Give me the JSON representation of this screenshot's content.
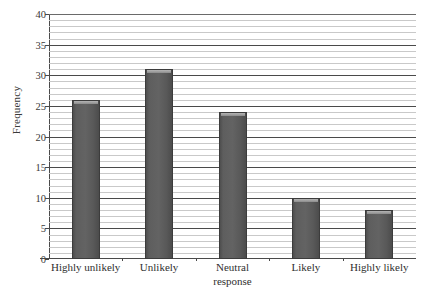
{
  "chart_data": {
    "type": "bar",
    "title": "",
    "xlabel": "",
    "ylabel": "Frequency",
    "categories": [
      "Highly unlikely",
      "Unlikely",
      "Neutral response",
      "Likely",
      "Highly likely"
    ],
    "category_lines": [
      [
        "Highly unlikely"
      ],
      [
        "Unlikely"
      ],
      [
        "Neutral",
        "response"
      ],
      [
        "Likely"
      ],
      [
        "Highly likely"
      ]
    ],
    "values": [
      26,
      31,
      24,
      10,
      8
    ],
    "ylim": [
      0,
      40
    ],
    "xlim": [
      0,
      5
    ],
    "y_major_ticks": [
      0,
      5,
      10,
      15,
      20,
      25,
      30,
      35,
      40
    ],
    "y_tick_labels": [
      "0",
      "5",
      "10",
      "15",
      "20",
      "25",
      "30",
      "35",
      "40"
    ],
    "y_minor_tick_step": 1,
    "grid": true,
    "grid_axis": "y",
    "legend": null,
    "legend_position": "none",
    "bar_color": "#5e5e5e",
    "bar_edge_color": "#3c3c3c",
    "grid_minor_color": "#c9c9c9",
    "grid_major_color": "#4a4a4a",
    "axis_color": "#4a4a4a",
    "background_color": "#ffffff"
  }
}
